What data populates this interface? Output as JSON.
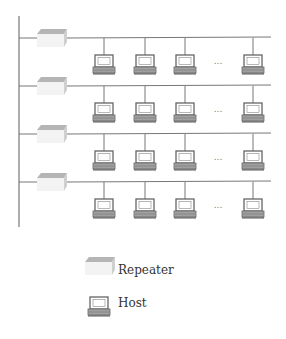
{
  "diagram": {
    "type": "network-topology",
    "segments": [
      {
        "id": 1,
        "bus_y": 38,
        "hosts": 4,
        "ellipsis": "..."
      },
      {
        "id": 2,
        "bus_y": 86,
        "hosts": 4,
        "ellipsis": "..."
      },
      {
        "id": 3,
        "bus_y": 134,
        "hosts": 4,
        "ellipsis": "..."
      },
      {
        "id": 4,
        "bus_y": 182,
        "hosts": 4,
        "ellipsis": "..."
      }
    ],
    "host_x": [
      104,
      145,
      185,
      253
    ],
    "ellipsis_x": 218
  },
  "legend": {
    "items": [
      {
        "icon": "repeater-icon",
        "label": "Repeater"
      },
      {
        "icon": "host-icon",
        "label": "Host"
      }
    ]
  },
  "colors": {
    "line": "#777777",
    "repeater_top": "#b8b8b8",
    "repeater_front": "#f2f2f2",
    "repeater_side": "#d0d0d0",
    "host_outline": "#666666",
    "host_base": "#999999"
  }
}
